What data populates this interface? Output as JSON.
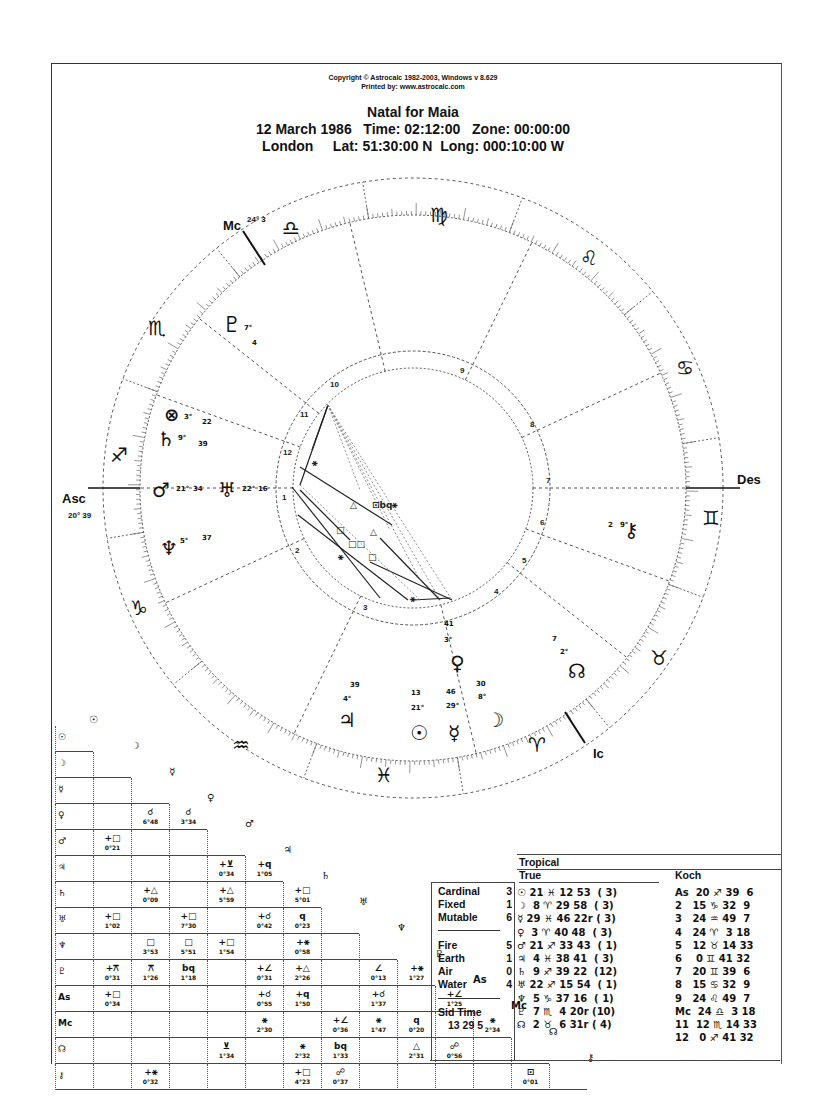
{
  "header": {
    "copyright": "Copyright © Astrocalc 1982-2003, Windows v 8.629",
    "printed_by": "Printed by: www.astrocalc.com",
    "title": "Natal for Maia",
    "date_line": "12 March 1986   Time: 02:12:00   Zone: 00:00:00",
    "place_line": "London     Lat: 51:30:00 N  Long: 000:10:00 W"
  },
  "wheel": {
    "angles": {
      "asc_label": "Asc",
      "asc_degree": "20° 39",
      "mc_label": "Mc",
      "mc_degree": "24° 3",
      "des_label": "Des",
      "ic_label": "Ic"
    },
    "signs": [
      {
        "name": "sagittarius",
        "glyph": "♐"
      },
      {
        "name": "scorpio",
        "glyph": "♏"
      },
      {
        "name": "libra",
        "glyph": "♎"
      },
      {
        "name": "virgo",
        "glyph": "♍"
      },
      {
        "name": "leo",
        "glyph": "♌"
      },
      {
        "name": "cancer",
        "glyph": "♋"
      },
      {
        "name": "gemini",
        "glyph": "♊"
      },
      {
        "name": "taurus",
        "glyph": "♉"
      },
      {
        "name": "aries",
        "glyph": "♈"
      },
      {
        "name": "pisces",
        "glyph": "♓"
      },
      {
        "name": "aquarius",
        "glyph": "♒"
      },
      {
        "name": "capricorn",
        "glyph": "♑"
      }
    ],
    "house_numbers": [
      "1",
      "2",
      "3",
      "4",
      "5",
      "6",
      "7",
      "8",
      "9",
      "10",
      "11",
      "12"
    ],
    "planets": [
      {
        "name": "pluto",
        "glyph": "♇",
        "deg": "7°",
        "min": "4"
      },
      {
        "name": "part-of-fortune",
        "glyph": "⊗",
        "deg": "3°",
        "min": "22"
      },
      {
        "name": "saturn",
        "glyph": "♄",
        "deg": "9°",
        "min": "39"
      },
      {
        "name": "mars",
        "glyph": "♂",
        "deg": "21°",
        "min": "34"
      },
      {
        "name": "uranus",
        "glyph": "♅",
        "deg": "22°",
        "min": "16"
      },
      {
        "name": "neptune",
        "glyph": "♆",
        "deg": "5°",
        "min": "37"
      },
      {
        "name": "chiron",
        "glyph": "⚷",
        "deg": "9°",
        "min": "2"
      },
      {
        "name": "north-node",
        "glyph": "☊",
        "deg": "2°",
        "min": "7"
      },
      {
        "name": "venus",
        "glyph": "♀",
        "deg": "3°",
        "min": "41"
      },
      {
        "name": "jupiter",
        "glyph": "♃",
        "deg": "4°",
        "min": "39"
      },
      {
        "name": "sun",
        "glyph": "☉",
        "deg": "21°",
        "min": "13"
      },
      {
        "name": "mercury",
        "glyph": "☿",
        "deg": "29°",
        "min": "46"
      },
      {
        "name": "moon",
        "glyph": "☽",
        "deg": "8°",
        "min": "30"
      }
    ]
  },
  "aspect_grid": {
    "headers": [
      "☉",
      "☽",
      "☿",
      "♀",
      "♂",
      "♃",
      "♄",
      "♅",
      "♆",
      "♇",
      "As",
      "Mc",
      "☊",
      "⚷"
    ],
    "rows": [
      {
        "label": "☉",
        "cells": []
      },
      {
        "label": "☽",
        "cells": []
      },
      {
        "label": "☿",
        "cells": []
      },
      {
        "label": "♀",
        "cells": [
          {
            "c": 1,
            "a": "☌",
            "o": "6°48"
          },
          {
            "c": 2,
            "a": "☌",
            "o": "3°34"
          }
        ]
      },
      {
        "label": "♂",
        "cells": [
          {
            "c": 0,
            "a": "+□",
            "o": "0°21"
          }
        ]
      },
      {
        "label": "♃",
        "cells": [
          {
            "c": 3,
            "a": "+⊻",
            "o": "0°34"
          },
          {
            "c": 4,
            "a": "+q",
            "o": "1°05"
          }
        ]
      },
      {
        "label": "♄",
        "cells": [
          {
            "c": 1,
            "a": "+△",
            "o": "0°09"
          },
          {
            "c": 3,
            "a": "+△",
            "o": "5°59"
          },
          {
            "c": 5,
            "a": "+□",
            "o": "5°01"
          }
        ]
      },
      {
        "label": "♅",
        "cells": [
          {
            "c": 0,
            "a": "+□",
            "o": "1°02"
          },
          {
            "c": 2,
            "a": "+□",
            "o": "7°30"
          },
          {
            "c": 4,
            "a": "+☌",
            "o": "0°42"
          },
          {
            "c": 5,
            "a": "q",
            "o": "0°23"
          }
        ]
      },
      {
        "label": "♆",
        "cells": [
          {
            "c": 1,
            "a": "□",
            "o": "3°53"
          },
          {
            "c": 2,
            "a": "□",
            "o": "5°51"
          },
          {
            "c": 3,
            "a": "+□",
            "o": "1°54"
          },
          {
            "c": 5,
            "a": "+⚹",
            "o": "0°58"
          }
        ]
      },
      {
        "label": "♇",
        "cells": [
          {
            "c": 0,
            "a": "+⚻",
            "o": "0°31"
          },
          {
            "c": 1,
            "a": "⚻",
            "o": "1°26"
          },
          {
            "c": 2,
            "a": "bq",
            "o": "1°18"
          },
          {
            "c": 4,
            "a": "+∠",
            "o": "0°31"
          },
          {
            "c": 5,
            "a": "+△",
            "o": "2°26"
          },
          {
            "c": 7,
            "a": "∠",
            "o": "0°13"
          },
          {
            "c": 8,
            "a": "+⚹",
            "o": "1°27"
          }
        ]
      },
      {
        "label": "As",
        "cells": [
          {
            "c": 0,
            "a": "+□",
            "o": "0°34"
          },
          {
            "c": 4,
            "a": "+☌",
            "o": "0°55"
          },
          {
            "c": 5,
            "a": "+q",
            "o": "1°50"
          },
          {
            "c": 7,
            "a": "+☌",
            "o": "1°37"
          },
          {
            "c": 9,
            "a": "+∠",
            "o": "1°25"
          }
        ]
      },
      {
        "label": "Mc",
        "cells": [
          {
            "c": 4,
            "a": "⚹",
            "o": "2°30"
          },
          {
            "c": 6,
            "a": "+∠",
            "o": "0°36"
          },
          {
            "c": 7,
            "a": "⚹",
            "o": "1°47"
          },
          {
            "c": 8,
            "a": "q",
            "o": "0°20"
          },
          {
            "c": 10,
            "a": "⚹",
            "o": "2°34"
          }
        ]
      },
      {
        "label": "☊",
        "cells": [
          {
            "c": 3,
            "a": "⊻",
            "o": "1°34"
          },
          {
            "c": 5,
            "a": "⚹",
            "o": "2°32"
          },
          {
            "c": 6,
            "a": "bq",
            "o": "1°33"
          },
          {
            "c": 8,
            "a": "△",
            "o": "2°31"
          },
          {
            "c": 9,
            "a": "☍",
            "o": "0°56"
          }
        ]
      },
      {
        "label": "⚷",
        "cells": [
          {
            "c": 1,
            "a": "+⚹",
            "o": "0°32"
          },
          {
            "c": 5,
            "a": "+□",
            "o": "4°23"
          },
          {
            "c": 6,
            "a": "☍",
            "o": "0°37"
          },
          {
            "c": 11,
            "a": "⊡",
            "o": "0°01"
          }
        ]
      }
    ]
  },
  "elements": {
    "modes": [
      {
        "label": "Cardinal",
        "n": "3"
      },
      {
        "label": "Fixed",
        "n": "1"
      },
      {
        "label": "Mutable",
        "n": "6"
      }
    ],
    "elements": [
      {
        "label": "Fire",
        "n": "5"
      },
      {
        "label": "Earth",
        "n": "1"
      },
      {
        "label": "Air",
        "n": "0"
      },
      {
        "label": "Water",
        "n": "4"
      }
    ],
    "sid_time_label": "Sid Time",
    "sid_time_value": "13 29 5"
  },
  "positions": {
    "zodiac": "Tropical",
    "node_type": "True",
    "house_system": "Koch",
    "planets": [
      "☉ 21 ♓ 12 53  ( 3)",
      "☽  8 ♈ 29 58  ( 3)",
      "☿ 29 ♓ 46 22r ( 3)",
      "♀  3 ♈ 40 48  ( 3)",
      "♂ 21 ♐ 33 43  ( 1)",
      "♃  4 ♓ 38 41  ( 3)",
      "♄  9 ♐ 39 22  (12)",
      "♅ 22 ♐ 15 54  ( 1)",
      "♆  5 ♑ 37 16  ( 1)",
      "♇  7 ♏  4 20r (10)",
      "☊  2 ♉  6 31r ( 4)"
    ],
    "houses": [
      "As  20 ♐ 39  6",
      "2   15 ♑ 32  9",
      "3   24 ♒ 49  7",
      "4   24 ♈  3 18",
      "5   12 ♉ 14 33",
      "6    0 ♊ 41 32",
      "7   20 ♊ 39  6",
      "8   15 ♋ 32  9",
      "9   24 ♌ 49  7",
      "Mc  24 ♎  3 18",
      "11  12 ♏ 14 33",
      "12   0 ♐ 41 32"
    ]
  }
}
